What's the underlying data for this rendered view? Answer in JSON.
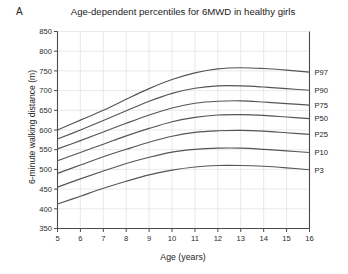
{
  "figure": {
    "panel_label": "A",
    "title": "Age-dependent percentiles for 6MWD in healthy girls",
    "xlabel": "Age (years)",
    "ylabel": "6-minute walking distance (m)"
  },
  "style": {
    "curve_color": "#555555",
    "axis_color": "#4a4a4a",
    "grid_color": "#e3e3e3",
    "background": "#ffffff"
  },
  "chart_data": {
    "type": "line",
    "title": "Age-dependent percentiles for 6MWD in healthy girls",
    "xlabel": "Age (years)",
    "ylabel": "6-minute walking distance (m)",
    "xlim": [
      5,
      16
    ],
    "ylim": [
      350,
      850
    ],
    "xticks": [
      5,
      6,
      7,
      8,
      9,
      10,
      11,
      12,
      13,
      14,
      15,
      16
    ],
    "yticks": [
      350,
      400,
      450,
      500,
      550,
      600,
      650,
      700,
      750,
      800,
      850
    ],
    "grid": true,
    "legend": "right-of-axes inline labels",
    "x": [
      5,
      6,
      7,
      8,
      9,
      10,
      11,
      12,
      13,
      14,
      15,
      16
    ],
    "series": [
      {
        "name": "P97",
        "label": "P97",
        "values": [
          600,
          625,
          650,
          678,
          705,
          728,
          745,
          755,
          758,
          756,
          752,
          747
        ]
      },
      {
        "name": "P90",
        "label": "P90",
        "values": [
          577,
          600,
          624,
          649,
          673,
          693,
          706,
          712,
          712,
          709,
          705,
          701
        ]
      },
      {
        "name": "P75",
        "label": "P75",
        "values": [
          552,
          573,
          595,
          617,
          638,
          656,
          668,
          673,
          674,
          671,
          667,
          663
        ]
      },
      {
        "name": "P50",
        "label": "P50",
        "values": [
          522,
          543,
          564,
          585,
          604,
          621,
          632,
          638,
          639,
          637,
          633,
          629
        ]
      },
      {
        "name": "P25",
        "label": "P25",
        "values": [
          490,
          511,
          532,
          551,
          569,
          584,
          594,
          598,
          599,
          597,
          593,
          589
        ]
      },
      {
        "name": "P10",
        "label": "P10",
        "values": [
          455,
          476,
          496,
          515,
          531,
          544,
          551,
          554,
          554,
          551,
          547,
          543
        ]
      },
      {
        "name": "P3",
        "label": "P3",
        "values": [
          412,
          432,
          452,
          470,
          486,
          498,
          506,
          510,
          510,
          508,
          504,
          499
        ]
      }
    ]
  }
}
